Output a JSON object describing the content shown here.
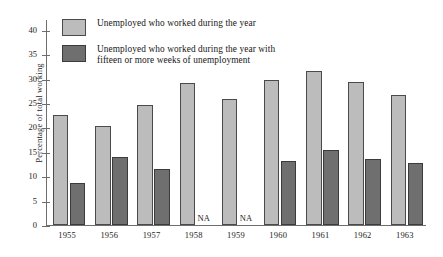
{
  "chart_data": {
    "type": "bar",
    "title": "",
    "xlabel": "",
    "ylabel": "Percentage of total working",
    "ylim": [
      0,
      42
    ],
    "yticks": [
      0,
      5,
      10,
      15,
      20,
      25,
      30,
      35,
      40
    ],
    "grid": false,
    "legend_position": "top-left",
    "categories": [
      "1955",
      "1956",
      "1957",
      "1958",
      "1959",
      "1960",
      "1961",
      "1962",
      "1963"
    ],
    "series": [
      {
        "name": "Unemployed who worked during the year",
        "color": "#bcbcbc",
        "values": [
          22.6,
          20.3,
          24.5,
          29.1,
          25.9,
          29.7,
          31.5,
          29.2,
          26.7
        ]
      },
      {
        "name": "Unemployed who worked during the year with fifteen or more weeks of unemployment",
        "color": "#6f6f6f",
        "values": [
          8.6,
          14.0,
          11.5,
          null,
          null,
          13.1,
          15.3,
          13.6,
          12.8
        ]
      }
    ],
    "missing_label": "NA",
    "annotations": [
      {
        "category": "1958",
        "series": 1,
        "text": "NA"
      },
      {
        "category": "1959",
        "series": 1,
        "text": "NA"
      }
    ]
  },
  "legend": {
    "items": [
      {
        "swatch": "light-gray-swatch",
        "label": "Unemployed who worked during the year"
      },
      {
        "swatch": "dark-gray-swatch",
        "label": "Unemployed who worked during the year with\nfifteen or more weeks of unemployment"
      }
    ]
  },
  "axis": {
    "y_title": "Percentage of total working",
    "y_tick_labels": [
      "40",
      "35",
      "30",
      "25",
      "20",
      "15",
      "10",
      "5",
      "0"
    ],
    "x_tick_labels": [
      "1955",
      "1956",
      "1957",
      "1958",
      "1959",
      "1960",
      "1961",
      "1962",
      "1963"
    ]
  },
  "colors": {
    "series_light": "#bcbcbc",
    "series_dark": "#6f6f6f",
    "axis": "#6d6d6d",
    "text": "#1d1d1d",
    "background": "#ffffff"
  }
}
